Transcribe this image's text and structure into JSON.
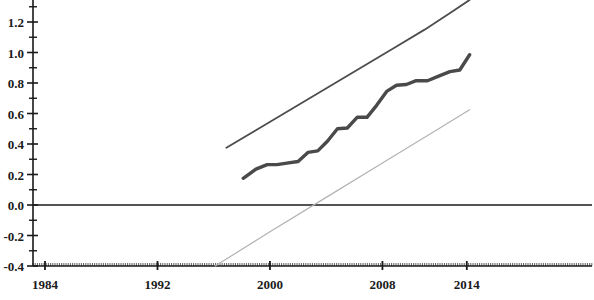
{
  "chart_data": {
    "type": "line",
    "title": "",
    "subtitle": "",
    "xlabel": "",
    "ylabel": "",
    "xlim": [
      1984,
      2016
    ],
    "ylim": [
      -0.4,
      1.4
    ],
    "grid": false,
    "legend_position": "none",
    "x_ticks": [
      1984,
      1992,
      2000,
      2008,
      2014
    ],
    "x_tick_labels": [
      "1984",
      "1992",
      "2000",
      "2008",
      "2014"
    ],
    "y_ticks": [
      -0.4,
      -0.2,
      0.0,
      0.2,
      0.4,
      0.6,
      0.8,
      1.0,
      1.2,
      1.4
    ],
    "y_tick_labels": [
      "-0.4",
      "-0.2",
      "0.0",
      "0.2",
      "0.4",
      "0.6",
      "0.8",
      "1.0",
      "1.2",
      "1.4"
    ],
    "y_minor_ticks": [
      -0.3,
      -0.1,
      0.1,
      0.3,
      0.5,
      0.7,
      0.9,
      1.1,
      1.3
    ],
    "zero_line": 0.0,
    "series": [
      {
        "name": "upper-bound",
        "color": "#4d4d4d",
        "width": 1.8,
        "style": "solid",
        "x": [
          1996.9,
          1999,
          2001,
          2003,
          2005,
          2007,
          2009,
          2011,
          2013,
          2014.2
        ],
        "values": [
          0.375,
          0.49,
          0.6,
          0.71,
          0.82,
          0.93,
          1.04,
          1.15,
          1.27,
          1.345
        ]
      },
      {
        "name": "estimate",
        "color": "#4a4a4a",
        "width": 3.4,
        "style": "solid",
        "x": [
          1998.1,
          1999.0,
          1999.8,
          2000.5,
          2001.2,
          2002.0,
          2002.7,
          2003.4,
          2004.1,
          2004.8,
          2005.5,
          2006.2,
          2006.9,
          2007.6,
          2008.3,
          2009.0,
          2009.7,
          2010.4,
          2011.2,
          2012.0,
          2012.8,
          2013.5,
          2014.2
        ],
        "values": [
          0.175,
          0.235,
          0.265,
          0.265,
          0.275,
          0.285,
          0.345,
          0.355,
          0.42,
          0.5,
          0.505,
          0.575,
          0.575,
          0.655,
          0.745,
          0.785,
          0.79,
          0.815,
          0.815,
          0.845,
          0.875,
          0.885,
          0.985
        ]
      },
      {
        "name": "lower-bound",
        "color": "#b3b3b3",
        "width": 1.2,
        "style": "solid",
        "x": [
          1996.1,
          2000,
          2004,
          2008,
          2012,
          2014.2
        ],
        "values": [
          -0.4,
          -0.175,
          0.05,
          0.275,
          0.5,
          0.625
        ]
      }
    ],
    "annotations": []
  },
  "colors": {
    "axis": "#1a1a1a",
    "background": "#ffffff",
    "upper_line": "#4d4d4d",
    "estimate_line": "#4a4a4a",
    "lower_line": "#b3b3b3",
    "zero_line": "#1a1a1a"
  }
}
